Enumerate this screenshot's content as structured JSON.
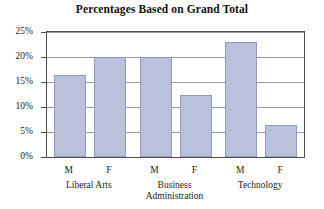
{
  "chart_data": {
    "type": "bar",
    "title": "Percentages Based on Grand Total",
    "xlabel": "",
    "ylabel": "",
    "ylim": [
      0,
      25
    ],
    "grid": true,
    "legend": null,
    "y_ticks": [
      {
        "value": 0,
        "label": "0%"
      },
      {
        "value": 5,
        "label": "5%"
      },
      {
        "value": 10,
        "label": "10%"
      },
      {
        "value": 15,
        "label": "15%"
      },
      {
        "value": 20,
        "label": "20%"
      },
      {
        "value": 25,
        "label": "25%"
      }
    ],
    "groups": [
      {
        "label": "Liberal Arts",
        "label_lines": [
          "Liberal Arts"
        ]
      },
      {
        "label": "Business Administration",
        "label_lines": [
          "Business",
          "Administration"
        ]
      },
      {
        "label": "Technology",
        "label_lines": [
          "Technology"
        ]
      }
    ],
    "categories": [
      "Liberal Arts M",
      "Liberal Arts F",
      "Business Administration M",
      "Business Administration F",
      "Technology M",
      "Technology F"
    ],
    "bars": [
      {
        "group": "Liberal Arts",
        "sub": "M",
        "value": 16.5
      },
      {
        "group": "Liberal Arts",
        "sub": "F",
        "value": 20.0
      },
      {
        "group": "Business Administration",
        "sub": "M",
        "value": 20.0
      },
      {
        "group": "Business Administration",
        "sub": "F",
        "value": 12.5
      },
      {
        "group": "Technology",
        "sub": "M",
        "value": 23.0
      },
      {
        "group": "Technology",
        "sub": "F",
        "value": 6.5
      }
    ],
    "values": [
      16.5,
      20.0,
      20.0,
      12.5,
      23.0,
      6.5
    ],
    "colors": {
      "bar_fill": "#b9c1dd",
      "bar_border": "#8f9ac4",
      "grid": "#9a9a9a",
      "frame": "#4d4d4d",
      "text": "#1a1a1a",
      "background": "#ffffff"
    }
  }
}
